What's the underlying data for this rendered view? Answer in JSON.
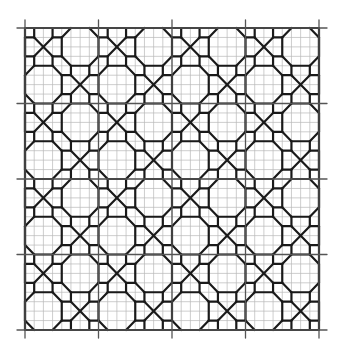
{
  "figure": {
    "background": "#ffffff",
    "grid": {
      "left": 25,
      "top": 28,
      "right": 319,
      "bottom": 330,
      "major_divisions": 4,
      "minor_per_major": 8,
      "minor_color": "#b8b8b8",
      "major_color": "#555555",
      "major_overhang": 8
    },
    "pattern": {
      "stroke": "#1a1a1a",
      "stroke_width": 2.2
    }
  }
}
